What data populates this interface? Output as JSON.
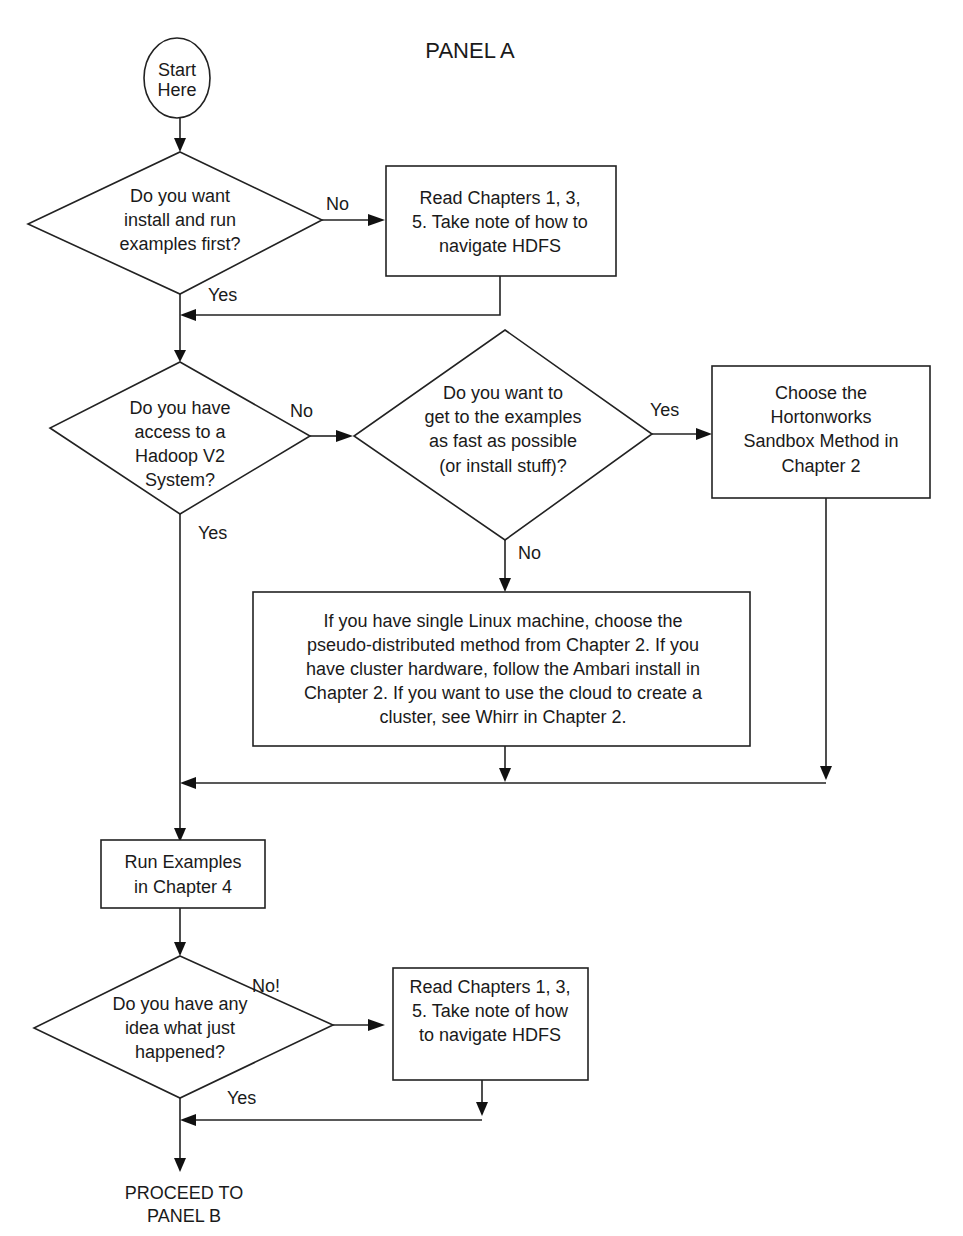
{
  "title": "PANEL A",
  "nodes": {
    "start": {
      "lines": [
        "Start",
        "Here"
      ]
    },
    "q_install_first": {
      "lines": [
        "Do you want",
        "install and run",
        "examples first?"
      ]
    },
    "read_ch_1": {
      "lines": [
        "Read Chapters 1, 3,",
        "5. Take note of how to",
        "navigate HDFS"
      ]
    },
    "q_access_hadoop": {
      "lines": [
        "Do you have",
        "access to a",
        "Hadoop V2",
        "System?"
      ]
    },
    "q_fast": {
      "lines": [
        "Do you want to",
        "get to the examples",
        "as fast as possible",
        "(or install stuff)?"
      ]
    },
    "sandbox": {
      "lines": [
        "Choose the",
        "Hortonworks",
        "Sandbox Method in",
        "Chapter 2"
      ]
    },
    "install_options": {
      "lines": [
        "If you have single Linux machine, choose the",
        "pseudo-distributed method from Chapter 2. If you",
        "have cluster hardware, follow the Ambari install in",
        "Chapter 2. If you want to use the cloud to create a",
        "cluster, see Whirr in Chapter 2."
      ]
    },
    "run_examples": {
      "lines": [
        "Run Examples",
        "in Chapter 4"
      ]
    },
    "q_idea": {
      "lines": [
        "Do you have any",
        "idea what just",
        "happened?"
      ]
    },
    "read_ch_2": {
      "lines": [
        "Read Chapters 1, 3,",
        "5. Take note of how",
        "to navigate HDFS"
      ]
    },
    "end": {
      "lines": [
        "PROCEED TO",
        "PANEL B"
      ]
    }
  },
  "edge_labels": {
    "install_no": "No",
    "install_yes": "Yes",
    "access_no": "No",
    "access_yes": "Yes",
    "fast_yes": "Yes",
    "fast_no": "No",
    "idea_no": "No!",
    "idea_yes": "Yes"
  }
}
